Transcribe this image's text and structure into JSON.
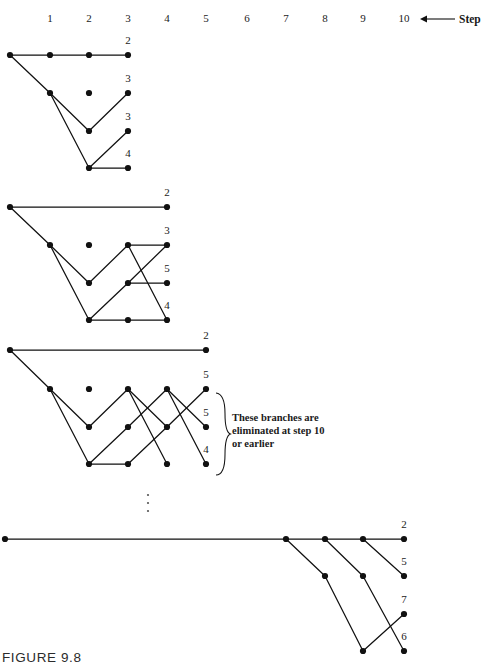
{
  "figure": {
    "caption": "FIGURE 9.8",
    "axis": {
      "step_word": "Step",
      "step_ticks": [
        "1",
        "2",
        "3",
        "4",
        "5",
        "6",
        "7",
        "8",
        "9",
        "10"
      ],
      "tick_x": [
        50,
        89,
        128,
        167,
        206,
        247,
        286,
        325,
        363,
        404
      ],
      "tick_y": 22,
      "arrow_from_x": 455,
      "arrow_to_x": 420,
      "arrow_y": 19,
      "step_word_x": 459,
      "step_word_y": 23
    },
    "annotation": {
      "lines": [
        "These branches are",
        "eliminated at step 10",
        "or earlier"
      ],
      "x": 232,
      "y": 421,
      "line_height": 13,
      "brace": {
        "x": 217,
        "top": 393,
        "bottom": 475,
        "width": 9
      }
    },
    "ellipsis": {
      "x": 148,
      "dots_y": [
        495,
        503,
        511
      ],
      "radius": 1.1
    }
  },
  "chart_data": {
    "type": "diagram",
    "node_radius": 3.1,
    "panels": [
      {
        "name": "panel-1",
        "row_y": [
          55,
          93,
          131,
          168
        ],
        "nodes": [
          {
            "id": "a0",
            "x": 10,
            "y": 55
          },
          {
            "id": "a1",
            "x": 50,
            "y": 55
          },
          {
            "id": "a2",
            "x": 89,
            "y": 55
          },
          {
            "id": "a3",
            "x": 128,
            "y": 55
          },
          {
            "id": "b1",
            "x": 50,
            "y": 93
          },
          {
            "id": "b2",
            "x": 89,
            "y": 93
          },
          {
            "id": "b3",
            "x": 128,
            "y": 93
          },
          {
            "id": "c2",
            "x": 89,
            "y": 131
          },
          {
            "id": "c3",
            "x": 128,
            "y": 131
          },
          {
            "id": "d2",
            "x": 89,
            "y": 168
          },
          {
            "id": "d3",
            "x": 128,
            "y": 168
          }
        ],
        "edges": [
          [
            "a0",
            "a1"
          ],
          [
            "a1",
            "a2"
          ],
          [
            "a2",
            "a3"
          ],
          [
            "a0",
            "b1"
          ],
          [
            "b1",
            "c2"
          ],
          [
            "c2",
            "b3"
          ],
          [
            "b1",
            "d2"
          ],
          [
            "d2",
            "c3"
          ],
          [
            "d2",
            "d3"
          ]
        ],
        "labels": [
          {
            "text": "2",
            "x": 128,
            "y": 44
          },
          {
            "text": "3",
            "x": 128,
            "y": 82
          },
          {
            "text": "3",
            "x": 128,
            "y": 120
          },
          {
            "text": "4",
            "x": 128,
            "y": 157
          }
        ]
      },
      {
        "name": "panel-2",
        "row_y": [
          207,
          245,
          283,
          320
        ],
        "nodes": [
          {
            "id": "a0",
            "x": 10,
            "y": 207
          },
          {
            "id": "a4",
            "x": 167,
            "y": 207
          },
          {
            "id": "b1",
            "x": 50,
            "y": 245
          },
          {
            "id": "b2",
            "x": 89,
            "y": 245
          },
          {
            "id": "b3",
            "x": 128,
            "y": 245
          },
          {
            "id": "b4",
            "x": 167,
            "y": 245
          },
          {
            "id": "c2",
            "x": 89,
            "y": 283
          },
          {
            "id": "c3",
            "x": 128,
            "y": 283
          },
          {
            "id": "c4",
            "x": 167,
            "y": 283
          },
          {
            "id": "d2",
            "x": 89,
            "y": 320
          },
          {
            "id": "d3",
            "x": 128,
            "y": 320
          },
          {
            "id": "d4",
            "x": 167,
            "y": 320
          }
        ],
        "edges": [
          [
            "a0",
            "a4"
          ],
          [
            "a0",
            "b1"
          ],
          [
            "b1",
            "c2"
          ],
          [
            "c2",
            "b3"
          ],
          [
            "b3",
            "b4"
          ],
          [
            "b1",
            "d2"
          ],
          [
            "d2",
            "c3"
          ],
          [
            "c3",
            "c4"
          ],
          [
            "d2",
            "d3"
          ],
          [
            "d3",
            "d4"
          ],
          [
            "b3",
            "d4"
          ],
          [
            "c3",
            "b4"
          ]
        ],
        "labels": [
          {
            "text": "2",
            "x": 167,
            "y": 196
          },
          {
            "text": "3",
            "x": 167,
            "y": 234
          },
          {
            "text": "5",
            "x": 167,
            "y": 272
          },
          {
            "text": "4",
            "x": 167,
            "y": 309
          }
        ]
      },
      {
        "name": "panel-3",
        "row_y": [
          350,
          389,
          427,
          464
        ],
        "nodes": [
          {
            "id": "a0",
            "x": 10,
            "y": 350
          },
          {
            "id": "a5",
            "x": 206,
            "y": 350
          },
          {
            "id": "b1",
            "x": 50,
            "y": 389
          },
          {
            "id": "b2",
            "x": 89,
            "y": 389
          },
          {
            "id": "b3",
            "x": 128,
            "y": 389
          },
          {
            "id": "b4",
            "x": 167,
            "y": 389
          },
          {
            "id": "b5",
            "x": 206,
            "y": 389
          },
          {
            "id": "c2",
            "x": 89,
            "y": 427
          },
          {
            "id": "c3",
            "x": 128,
            "y": 427
          },
          {
            "id": "c4",
            "x": 167,
            "y": 427
          },
          {
            "id": "c5",
            "x": 206,
            "y": 427
          },
          {
            "id": "d2",
            "x": 89,
            "y": 464
          },
          {
            "id": "d3",
            "x": 128,
            "y": 464
          },
          {
            "id": "d4",
            "x": 167,
            "y": 464
          },
          {
            "id": "d5",
            "x": 206,
            "y": 464
          }
        ],
        "edges": [
          [
            "a0",
            "a5"
          ],
          [
            "a0",
            "b1"
          ],
          [
            "b1",
            "c2"
          ],
          [
            "c2",
            "b3"
          ],
          [
            "b1",
            "d2"
          ],
          [
            "d2",
            "c3"
          ],
          [
            "d2",
            "d3"
          ],
          [
            "c3",
            "b4"
          ],
          [
            "d3",
            "c4"
          ],
          [
            "b3",
            "c4"
          ],
          [
            "b3",
            "d4"
          ],
          [
            "b4",
            "c5"
          ],
          [
            "b4",
            "d5"
          ],
          [
            "c4",
            "b5"
          ]
        ],
        "labels": [
          {
            "text": "2",
            "x": 206,
            "y": 339
          },
          {
            "text": "5",
            "x": 206,
            "y": 378
          },
          {
            "text": "5",
            "x": 206,
            "y": 416
          },
          {
            "text": "4",
            "x": 206,
            "y": 453
          }
        ]
      },
      {
        "name": "panel-4",
        "row_y": [
          539,
          576,
          614,
          651
        ],
        "nodes": [
          {
            "id": "a0",
            "x": 5,
            "y": 539
          },
          {
            "id": "a7",
            "x": 286,
            "y": 539
          },
          {
            "id": "a8",
            "x": 325,
            "y": 539
          },
          {
            "id": "a9",
            "x": 363,
            "y": 539
          },
          {
            "id": "a10",
            "x": 404,
            "y": 539
          },
          {
            "id": "b8",
            "x": 325,
            "y": 576
          },
          {
            "id": "b9",
            "x": 363,
            "y": 576
          },
          {
            "id": "b10",
            "x": 404,
            "y": 576
          },
          {
            "id": "c10",
            "x": 404,
            "y": 614
          },
          {
            "id": "d9",
            "x": 363,
            "y": 651
          },
          {
            "id": "d10",
            "x": 404,
            "y": 651
          }
        ],
        "edges": [
          [
            "a0",
            "a7"
          ],
          [
            "a7",
            "a8"
          ],
          [
            "a8",
            "a9"
          ],
          [
            "a9",
            "a10"
          ],
          [
            "a9",
            "b10"
          ],
          [
            "a8",
            "b9"
          ],
          [
            "b9",
            "d10"
          ],
          [
            "a7",
            "b8"
          ],
          [
            "b8",
            "d9"
          ],
          [
            "d9",
            "c10"
          ]
        ],
        "labels": [
          {
            "text": "2",
            "x": 404,
            "y": 528
          },
          {
            "text": "5",
            "x": 404,
            "y": 565
          },
          {
            "text": "7",
            "x": 404,
            "y": 603
          },
          {
            "text": "6",
            "x": 404,
            "y": 640
          }
        ]
      }
    ]
  }
}
